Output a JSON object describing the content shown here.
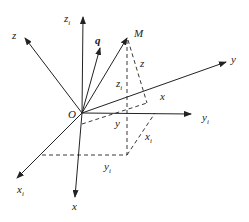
{
  "diagram": {
    "type": "coordinate-frame-rotation",
    "origin": {
      "label": "O",
      "x": 82,
      "y": 113
    },
    "axes": [
      {
        "id": "zi",
        "label": "z",
        "sub": "i",
        "end": [
          83,
          17
        ],
        "label_pos": [
          64,
          22
        ]
      },
      {
        "id": "z",
        "label": "z",
        "sub": "",
        "end": [
          25,
          38
        ],
        "label_pos": [
          12,
          39
        ]
      },
      {
        "id": "y",
        "label": "y",
        "sub": "",
        "end": [
          226,
          62
        ],
        "label_pos": [
          231,
          63
        ]
      },
      {
        "id": "yi",
        "label": "y",
        "sub": "i",
        "end": [
          191,
          114
        ],
        "label_pos": [
          202,
          121
        ]
      },
      {
        "id": "xi",
        "label": "x",
        "sub": "i",
        "end": [
          17,
          178
        ],
        "label_pos": [
          17,
          193
        ]
      },
      {
        "id": "x",
        "label": "x",
        "sub": "",
        "end": [
          75,
          197
        ],
        "label_pos": [
          72,
          210
        ]
      }
    ],
    "vectors": [
      {
        "id": "q",
        "label": "q",
        "end": [
          100,
          48
        ],
        "label_pos": [
          95,
          44
        ],
        "bold": true
      },
      {
        "id": "M",
        "label": "M",
        "end": [
          127,
          38
        ],
        "label_pos": [
          134,
          37
        ],
        "bold": false
      }
    ],
    "dashed_labels": [
      {
        "label": "z",
        "sub": "i",
        "pos": [
          116,
          87
        ]
      },
      {
        "label": "z",
        "sub": "",
        "pos": [
          140,
          67
        ]
      },
      {
        "label": "x",
        "sub": "",
        "pos": [
          160,
          100
        ]
      },
      {
        "label": "y",
        "sub": "",
        "pos": [
          115,
          127
        ]
      },
      {
        "label": "x",
        "sub": "i",
        "pos": [
          145,
          140
        ]
      },
      {
        "label": "y",
        "sub": "i",
        "pos": [
          104,
          170
        ]
      }
    ],
    "stroke_color": "#222222"
  }
}
